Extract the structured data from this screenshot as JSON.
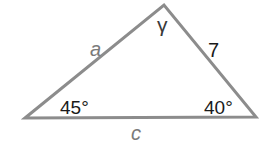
{
  "diagram": {
    "type": "triangle",
    "stroke_color": "#8c8c8c",
    "text_color": "#1a1a1a",
    "variable_color": "#7a7a7a",
    "vertices": {
      "left": [
        25,
        118
      ],
      "top": [
        164,
        5
      ],
      "right": [
        256,
        117
      ]
    },
    "sides": {
      "a": {
        "label": "a",
        "between": [
          "left",
          "top"
        ]
      },
      "b": {
        "label": "7",
        "between": [
          "top",
          "right"
        ]
      },
      "c": {
        "label": "c",
        "between": [
          "left",
          "right"
        ]
      }
    },
    "angles": {
      "top": {
        "label": "γ"
      },
      "left": {
        "label": "45°"
      },
      "right": {
        "label": "40°"
      }
    }
  }
}
